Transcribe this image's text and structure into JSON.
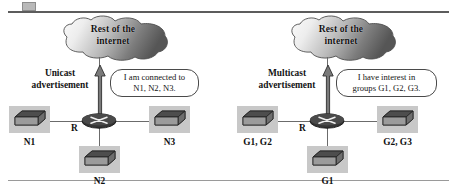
{
  "figure": {
    "artifact": "corner-marker",
    "colors": {
      "cloud_light": "#f2f2f2",
      "cloud_dark": "#5b5b5b",
      "host_backdrop": "#c8c8c8",
      "host_top": "#4c4c4c",
      "host_front": "#8e8e8e",
      "router_body": "#3a3a3a",
      "line": "#6b6b6b",
      "rule_top": "#5c5c5c",
      "rule_bottom": "#9a9a9a",
      "text": "#111111"
    },
    "panels": [
      {
        "id": "unicast",
        "cloud": {
          "line1": "Rest of the",
          "line2": "internet"
        },
        "side_label": {
          "line1": "Unicast",
          "line2": "advertisement"
        },
        "bubble": {
          "line1": "I am connected to",
          "line2": "N1, N2, N3."
        },
        "router_label": "R",
        "hosts": [
          {
            "position": "left",
            "label": "N1"
          },
          {
            "position": "bottom",
            "label": "N2"
          },
          {
            "position": "right",
            "label": "N3"
          }
        ]
      },
      {
        "id": "multicast",
        "cloud": {
          "line1": "Rest of the",
          "line2": "internet"
        },
        "side_label": {
          "line1": "Multicast",
          "line2": "advertisement"
        },
        "bubble": {
          "line1": "I have interest in",
          "line2": "groups G1, G2, G3."
        },
        "router_label": "R",
        "hosts": [
          {
            "position": "left",
            "label": "G1, G2"
          },
          {
            "position": "bottom",
            "label": "G1"
          },
          {
            "position": "right",
            "label": "G2, G3"
          }
        ]
      }
    ]
  }
}
